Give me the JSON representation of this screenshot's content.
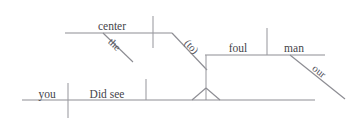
{
  "diagram": {
    "type": "reed-kellogg-sentence-diagram",
    "sentence": "Did you see the center foul our man",
    "canvas": {
      "width": 349,
      "height": 122
    },
    "ink_color": "#8d8d93",
    "text_color": "#44444a",
    "background_color": "#ffffff",
    "words": {
      "subject": "you",
      "verb": "Did see",
      "object": "center",
      "object_modifier": "the",
      "infinitive_marker": "(to)",
      "infinitive_verb": "foul",
      "infinitive_object": "man",
      "infinitive_object_modifier": "our"
    },
    "labels": [
      {
        "id": "center",
        "text": "center",
        "x": 112,
        "y": 30,
        "anchor": "middle",
        "slant": false
      },
      {
        "id": "the",
        "text": "the",
        "x": 112,
        "y": 47,
        "anchor": "middle",
        "slant": true,
        "rotate": 44
      },
      {
        "id": "to",
        "text": "(to)",
        "x": 189,
        "y": 49,
        "anchor": "middle",
        "slant": true,
        "rotate": 47
      },
      {
        "id": "foul",
        "text": "foul",
        "x": 238,
        "y": 52,
        "anchor": "middle",
        "slant": false
      },
      {
        "id": "man",
        "text": "man",
        "x": 294,
        "y": 52,
        "anchor": "middle",
        "slant": false
      },
      {
        "id": "our",
        "text": "our",
        "x": 317,
        "y": 74,
        "anchor": "middle",
        "slant": true,
        "rotate": 39
      },
      {
        "id": "you",
        "text": "you",
        "x": 47,
        "y": 98,
        "anchor": "middle",
        "slant": false
      },
      {
        "id": "did-see",
        "text": "Did see",
        "x": 107,
        "y": 98,
        "anchor": "middle",
        "slant": false
      }
    ],
    "strokes": [
      {
        "id": "object-baseline",
        "kind": "horizontal",
        "x1": 65,
        "y1": 33,
        "x2": 172,
        "y2": 33
      },
      {
        "id": "object-step-diagonal",
        "kind": "diagonal",
        "x1": 172,
        "y1": 33,
        "x2": 207,
        "y2": 70
      },
      {
        "id": "object-tick",
        "kind": "vertical",
        "x1": 153,
        "y1": 16,
        "x2": 153,
        "y2": 48
      },
      {
        "id": "the-modifier-slant",
        "kind": "diagonal",
        "x1": 103,
        "y1": 33,
        "x2": 133,
        "y2": 62
      },
      {
        "id": "infinitive-baseline",
        "kind": "horizontal",
        "x1": 205,
        "y1": 55,
        "x2": 325,
        "y2": 55
      },
      {
        "id": "infinitive-object-tick",
        "kind": "vertical",
        "x1": 267,
        "y1": 28,
        "x2": 267,
        "y2": 55
      },
      {
        "id": "our-modifier-slant",
        "kind": "diagonal",
        "x1": 290,
        "y1": 55,
        "x2": 345,
        "y2": 99
      },
      {
        "id": "infinitive-stem",
        "kind": "vertical",
        "x1": 206,
        "y1": 55,
        "x2": 206,
        "y2": 100
      },
      {
        "id": "pedestal-left",
        "kind": "diagonal",
        "x1": 206,
        "y1": 88,
        "x2": 192,
        "y2": 100
      },
      {
        "id": "pedestal-right",
        "kind": "diagonal",
        "x1": 206,
        "y1": 88,
        "x2": 220,
        "y2": 100
      },
      {
        "id": "main-baseline",
        "kind": "horizontal",
        "x1": 22,
        "y1": 100,
        "x2": 315,
        "y2": 100
      },
      {
        "id": "subject-verb-divider",
        "kind": "vertical",
        "x1": 68,
        "y1": 83,
        "x2": 68,
        "y2": 118
      },
      {
        "id": "verb-object-tick",
        "kind": "vertical",
        "x1": 146,
        "y1": 79,
        "x2": 146,
        "y2": 100
      }
    ]
  }
}
